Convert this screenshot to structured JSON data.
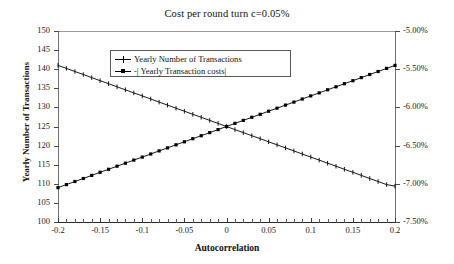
{
  "chart_data": {
    "type": "line",
    "title": "Cost per round turn c=0.05%",
    "xlabel": "Autocorrelation",
    "ylabel": "Yearly Number of Transactions",
    "ylabel_right": "- | Yearly Transaction Costs |",
    "grid": false,
    "legend_position": "upper-center",
    "xlim": [
      -0.2,
      0.2
    ],
    "ylim": [
      100,
      150
    ],
    "ylim_right": [
      -7.5,
      -5.0
    ],
    "xticks": [
      -0.2,
      -0.15,
      -0.1,
      -0.05,
      0,
      0.05,
      0.1,
      0.15,
      0.2
    ],
    "xticklabels": [
      "-0.2",
      "-0.15",
      "-0.1",
      "-0.05",
      "0",
      "0.05",
      "0.1",
      "0.15",
      "0.2"
    ],
    "yticks": [
      100,
      105,
      110,
      115,
      120,
      125,
      130,
      135,
      140,
      145,
      150
    ],
    "yticklabels": [
      "100",
      "105",
      "110",
      "115",
      "120",
      "125",
      "130",
      "135",
      "140",
      "145",
      "150"
    ],
    "yticks_right": [
      -7.5,
      -7.0,
      -6.5,
      -6.0,
      -5.5,
      -5.0
    ],
    "yticklabels_right": [
      "-7.50%",
      "-7.00%",
      "-6.50%",
      "-6.00%",
      "-5.50%",
      "-5.00%"
    ],
    "x": [
      -0.2,
      -0.19,
      -0.18,
      -0.17,
      -0.16,
      -0.15,
      -0.14,
      -0.13,
      -0.12,
      -0.11,
      -0.1,
      -0.09,
      -0.08,
      -0.07,
      -0.06,
      -0.05,
      -0.04,
      -0.03,
      -0.02,
      -0.01,
      0,
      0.01,
      0.02,
      0.03,
      0.04,
      0.05,
      0.06,
      0.07,
      0.08,
      0.09,
      0.1,
      0.11,
      0.12,
      0.13,
      0.14,
      0.15,
      0.16,
      0.17,
      0.18,
      0.19,
      0.2
    ],
    "series": [
      {
        "name": "Yearly Number of Transactions",
        "axis": "left",
        "marker": "plus",
        "values": [
          141.0,
          140.2,
          139.4,
          138.6,
          137.8,
          137.0,
          136.2,
          135.4,
          134.6,
          133.8,
          133.0,
          132.2,
          131.4,
          130.6,
          129.8,
          129.0,
          128.2,
          127.4,
          126.6,
          125.8,
          125.0,
          124.2,
          123.4,
          122.6,
          121.8,
          121.0,
          120.2,
          119.4,
          118.6,
          117.8,
          117.0,
          116.2,
          115.4,
          114.6,
          113.8,
          113.0,
          112.2,
          111.4,
          110.6,
          109.8,
          109.4
        ]
      },
      {
        "name": "-| Yearly Transaction costs|",
        "axis": "right",
        "marker": "square",
        "values": [
          -7.05,
          -7.01,
          -6.97,
          -6.93,
          -6.89,
          -6.85,
          -6.81,
          -6.77,
          -6.73,
          -6.69,
          -6.65,
          -6.61,
          -6.57,
          -6.53,
          -6.49,
          -6.45,
          -6.41,
          -6.37,
          -6.33,
          -6.29,
          -6.25,
          -6.21,
          -6.17,
          -6.13,
          -6.09,
          -6.05,
          -6.01,
          -5.97,
          -5.93,
          -5.89,
          -5.85,
          -5.81,
          -5.77,
          -5.73,
          -5.69,
          -5.65,
          -5.61,
          -5.57,
          -5.53,
          -5.49,
          -5.45
        ]
      }
    ],
    "legend": [
      "Yearly Number of Transactions",
      "-| Yearly Transaction costs|"
    ],
    "colors": {
      "series_line": "#000000",
      "axis": "#4a4a4a",
      "frame_top": "#9a9a9a",
      "background": "#ffffff"
    }
  }
}
